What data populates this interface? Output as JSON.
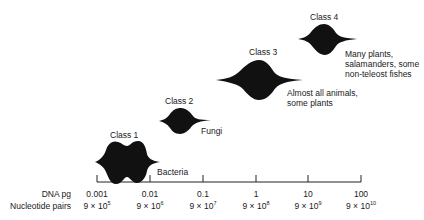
{
  "axis": {
    "row1_label": "DNA pg",
    "row2_label": "Nucleotide pairs",
    "ticks": [
      {
        "dna": "0.001",
        "base": "9 × 10",
        "exp": "5"
      },
      {
        "dna": "0.01",
        "base": "9 × 10",
        "exp": "6"
      },
      {
        "dna": "0.1",
        "base": "9 × 10",
        "exp": "7"
      },
      {
        "dna": "1",
        "base": "9 × 10",
        "exp": "8"
      },
      {
        "dna": "10",
        "base": "9 × 10",
        "exp": "9"
      },
      {
        "dna": "100",
        "base": "9 × 10",
        "exp": "10"
      }
    ]
  },
  "classes": [
    {
      "name": "Class 1",
      "organisms": [
        "Bacteria"
      ]
    },
    {
      "name": "Class 2",
      "organisms": [
        "Fungi"
      ]
    },
    {
      "name": "Class 3",
      "organisms": [
        "Almost all animals,",
        "some plants"
      ]
    },
    {
      "name": "Class 4",
      "organisms": [
        "Many plants,",
        "salamanders, some",
        "non-teleost fishes"
      ]
    }
  ],
  "colors": {
    "shape": "#111111",
    "axis": "#222222",
    "background": "#ffffff"
  }
}
